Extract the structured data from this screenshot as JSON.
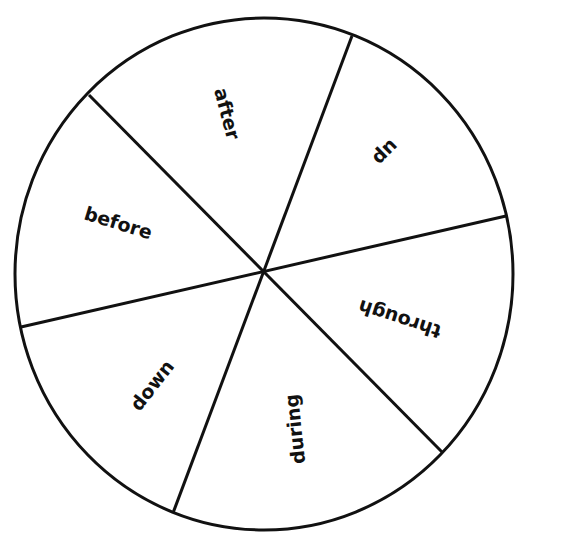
{
  "diagram": {
    "type": "spinner",
    "sections": 6,
    "words": [
      {
        "id": "after",
        "label": "after"
      },
      {
        "id": "up",
        "label": "up"
      },
      {
        "id": "through",
        "label": "through"
      },
      {
        "id": "during",
        "label": "during"
      },
      {
        "id": "down",
        "label": "down"
      },
      {
        "id": "before",
        "label": "before"
      }
    ],
    "stroke_color": "#111111",
    "background": "#ffffff"
  }
}
